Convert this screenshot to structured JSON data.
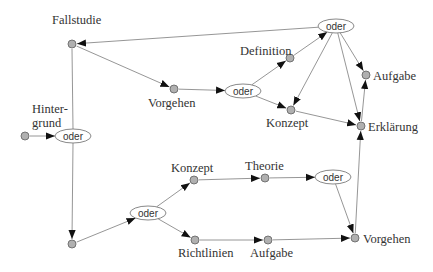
{
  "diagram": {
    "type": "flow-graph",
    "colors": {
      "node_fill": "#b0b0b0",
      "node_stroke": "#6a6a6a",
      "edge": "#8a8a8a",
      "text": "#333333"
    },
    "nodes": [
      {
        "id": "fallstudie",
        "kind": "point",
        "x": 72,
        "y": 44,
        "label": "Fallstudie",
        "lx": 52,
        "ly": 24
      },
      {
        "id": "hintergrund",
        "kind": "point",
        "x": 25,
        "y": 136,
        "label": "Hinter-",
        "label2": "grund",
        "lx": 32,
        "ly": 113,
        "ly2": 127
      },
      {
        "id": "oder-left",
        "kind": "oder",
        "x": 73,
        "y": 136,
        "label": "oder"
      },
      {
        "id": "bottom-left",
        "kind": "point",
        "x": 72,
        "y": 244
      },
      {
        "id": "vorgehen-mid",
        "kind": "point",
        "x": 174,
        "y": 89,
        "label": "Vorgehen",
        "lx": 148,
        "ly": 107
      },
      {
        "id": "oder-mid",
        "kind": "oder",
        "x": 243,
        "y": 91,
        "label": "oder"
      },
      {
        "id": "definition",
        "kind": "point",
        "x": 290,
        "y": 58,
        "label": "Definition",
        "lx": 240,
        "ly": 55
      },
      {
        "id": "konzept-top",
        "kind": "point",
        "x": 291,
        "y": 110,
        "label": "Konzept",
        "lx": 266,
        "ly": 127
      },
      {
        "id": "oder-top",
        "kind": "oder",
        "x": 336,
        "y": 26,
        "label": "oder"
      },
      {
        "id": "aufgabe-top",
        "kind": "point",
        "x": 366,
        "y": 75,
        "label": "Aufgabe",
        "lx": 373,
        "ly": 80
      },
      {
        "id": "erklaerung",
        "kind": "point",
        "x": 361,
        "y": 126,
        "label": "Erklärung",
        "lx": 368,
        "ly": 131
      },
      {
        "id": "oder-bottom",
        "kind": "oder",
        "x": 148,
        "y": 213,
        "label": "oder"
      },
      {
        "id": "konzept-bottom",
        "kind": "point",
        "x": 194,
        "y": 180,
        "label": "Konzept",
        "lx": 171,
        "ly": 172
      },
      {
        "id": "theorie",
        "kind": "point",
        "x": 265,
        "y": 178,
        "label": "Theorie",
        "lx": 245,
        "ly": 170
      },
      {
        "id": "oder-lower-right",
        "kind": "oder",
        "x": 333,
        "y": 177,
        "label": "oder"
      },
      {
        "id": "richtlinien",
        "kind": "point",
        "x": 195,
        "y": 240,
        "label": "Richtlinien",
        "lx": 178,
        "ly": 257
      },
      {
        "id": "aufgabe-bottom",
        "kind": "point",
        "x": 268,
        "y": 240,
        "label": "Aufgabe",
        "lx": 250,
        "ly": 257
      },
      {
        "id": "vorgehen-bottom",
        "kind": "point",
        "x": 355,
        "y": 238,
        "label": "Vorgehen",
        "lx": 363,
        "ly": 243
      }
    ],
    "edges": [
      {
        "from": "oder-top",
        "to": "fallstudie"
      },
      {
        "from": "fallstudie",
        "to": "vorgehen-mid"
      },
      {
        "from": "hintergrund",
        "to": "oder-left"
      },
      {
        "from": "fallstudie",
        "to": "bottom-left",
        "via_oder": "oder-left"
      },
      {
        "from": "vorgehen-mid",
        "to": "oder-mid"
      },
      {
        "from": "oder-mid",
        "to": "definition"
      },
      {
        "from": "oder-mid",
        "to": "konzept-top"
      },
      {
        "from": "definition",
        "to": "oder-top"
      },
      {
        "from": "oder-top",
        "to": "konzept-top"
      },
      {
        "from": "oder-top",
        "to": "aufgabe-top"
      },
      {
        "from": "oder-top",
        "to": "erklaerung"
      },
      {
        "from": "konzept-top",
        "to": "erklaerung"
      },
      {
        "from": "erklaerung",
        "to": "aufgabe-top"
      },
      {
        "from": "bottom-left",
        "to": "oder-bottom"
      },
      {
        "from": "oder-bottom",
        "to": "konzept-bottom"
      },
      {
        "from": "oder-bottom",
        "to": "richtlinien"
      },
      {
        "from": "konzept-bottom",
        "to": "theorie"
      },
      {
        "from": "theorie",
        "to": "oder-lower-right"
      },
      {
        "from": "richtlinien",
        "to": "aufgabe-bottom"
      },
      {
        "from": "aufgabe-bottom",
        "to": "vorgehen-bottom"
      },
      {
        "from": "oder-lower-right",
        "to": "vorgehen-bottom"
      },
      {
        "from": "vorgehen-bottom",
        "to": "erklaerung"
      }
    ]
  }
}
